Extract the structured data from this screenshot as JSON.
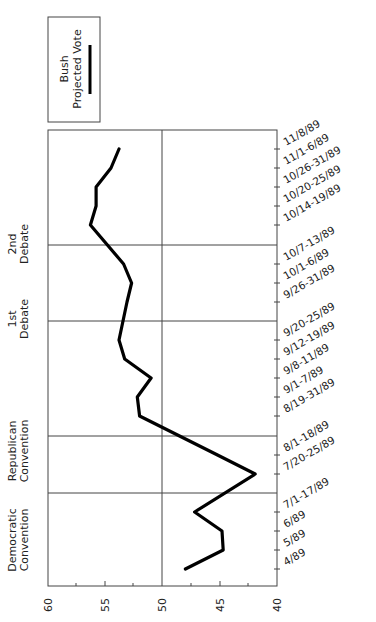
{
  "chart_data": {
    "type": "line",
    "orientation": "rotated-90",
    "title": "",
    "xlabel": "",
    "ylabel": "",
    "ylim": [
      40,
      60
    ],
    "yticks": [
      60,
      55,
      50,
      45,
      40
    ],
    "categories": [
      "4/89",
      "5/89",
      "6/89",
      "7/1-17/89",
      "7/20-25/89",
      "8/1-18/89",
      "8/19-31/89",
      "9/1-7/89",
      "9/8-11/89",
      "9/12-19/89",
      "9/20-25/89",
      "9/26-31/89",
      "10/1-6/89",
      "10/7-13/89",
      "10/14-19/89",
      "10/20-25/89",
      "10/26-31/89",
      "11/1-6/89",
      "11/8/89"
    ],
    "series": [
      {
        "name": "Bush Projected Vote",
        "values": [
          48.0,
          44.7,
          44.8,
          47.2,
          41.9,
          45.2,
          52.0,
          52.2,
          51.0,
          53.3,
          53.8,
          53.1,
          52.7,
          53.4,
          56.3,
          55.8,
          55.8,
          54.5,
          53.8
        ]
      }
    ],
    "legend": {
      "entries": [
        "Bush",
        "Projected Vote"
      ],
      "position": "top"
    },
    "annotations": [
      {
        "label": [
          "Democratic",
          "Convention"
        ],
        "between": [
          "7/1-17/89",
          "7/20-25/89"
        ]
      },
      {
        "label": [
          "Republican",
          "Convention"
        ],
        "between": [
          "8/1-18/89",
          "8/19-31/89"
        ]
      },
      {
        "label": [
          "1st",
          "Debate"
        ],
        "between": [
          "9/26-31/89",
          "10/1-6/89"
        ]
      },
      {
        "label": [
          "2nd",
          "Debate"
        ],
        "between": [
          "10/7-13/89",
          "10/14-19/89"
        ]
      }
    ],
    "grid": {
      "reference_line": 50
    }
  },
  "legend": {
    "line1": "Bush",
    "line2": "Projected Vote"
  },
  "annotations": {
    "dem1": "Democratic",
    "dem2": "Convention",
    "rep1": "Republican",
    "rep2": "Convention",
    "deb1a": "1st",
    "deb1b": "Debate",
    "deb2a": "2nd",
    "deb2b": "Debate"
  },
  "axis": {
    "t60": "60",
    "t55": "55",
    "t50": "50",
    "t45": "45",
    "t40": "40"
  },
  "cats": {
    "c0": "4/89",
    "c1": "5/89",
    "c2": "6/89",
    "c3": "7/1-17/89",
    "c4": "7/20-25/89",
    "c5": "8/1-18/89",
    "c6": "8/19-31/89",
    "c7": "9/1-7/89",
    "c8": "9/8-11/89",
    "c9": "9/12-19/89",
    "c10": "9/20-25/89",
    "c11": "9/26-31/89",
    "c12": "10/1-6/89",
    "c13": "10/7-13/89",
    "c14": "10/14-19/89",
    "c15": "10/20-25/89",
    "c16": "10/26-31/89",
    "c17": "11/1-6/89",
    "c18": "11/8/89"
  }
}
